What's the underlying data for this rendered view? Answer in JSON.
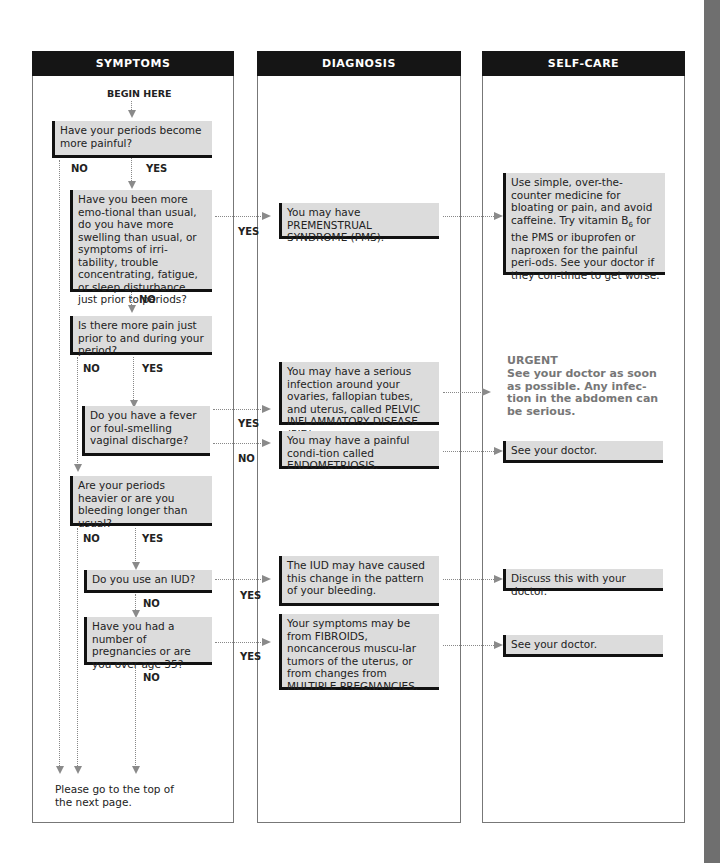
{
  "columns": {
    "symptoms": "SYMPTOMS",
    "diagnosis": "DIAGNOSIS",
    "selfcare": "SELF-CARE"
  },
  "begin_label": "BEGIN HERE",
  "questions": [
    {
      "id": "q1",
      "text": "Have your periods become more painful?"
    },
    {
      "id": "q2",
      "text": "Have you been more emo-tional than usual, do you have more swelling than usual, or symptoms of irri-tability, trouble concentrating, fatigue, or sleep disturbance just prior to periods?"
    },
    {
      "id": "q3",
      "text": "Is there more pain just prior to and during your period?"
    },
    {
      "id": "q4",
      "text": "Do you have a fever or foul-smelling vaginal discharge?"
    },
    {
      "id": "q5",
      "text": "Are your periods heavier or are you bleeding longer than usual?"
    },
    {
      "id": "q6",
      "text": "Do you use an IUD?"
    },
    {
      "id": "q7",
      "text": "Have you had a number of pregnancies or are you over age 35?"
    }
  ],
  "labels": {
    "yes": "YES",
    "no": "NO"
  },
  "diagnoses": [
    {
      "id": "pms",
      "text": "You may have PREMENSTRUAL SYNDROME (PMS)."
    },
    {
      "id": "pid",
      "text": "You may have a serious infection around your ovaries, fallopian tubes, and uterus, called PELVIC INFLAMMATORY DISEASE (PID)."
    },
    {
      "id": "endo",
      "text": "You may have a painful condi-tion called ENDOMETRIOSIS."
    },
    {
      "id": "iud",
      "text": "The IUD may have caused this change in the pattern of your bleeding."
    },
    {
      "id": "fibroids",
      "text": "Your symptoms may be from FIBROIDS, noncancerous muscu-lar tumors of the uterus, or from changes from MULTIPLE PREGNANCIES."
    }
  ],
  "selfcare": [
    {
      "id": "pms_care",
      "text_pre": "Use simple, over-the-counter medicine for bloating or pain, and avoid caffeine. Try vitamin B",
      "sub": "6",
      "text_post": " for the PMS or ibuprofen or naproxen for the painful peri-ods. See your doctor if they con-tinue to get worse."
    },
    {
      "id": "pid_care",
      "title": "URGENT",
      "text": "See your doctor as soon as possible. Any infec-tion in the abdomen can be serious."
    },
    {
      "id": "endo_care",
      "text": "See your doctor."
    },
    {
      "id": "iud_care",
      "text": "Discuss this with your doctor."
    },
    {
      "id": "fibroid_care",
      "text": "See your doctor."
    }
  ],
  "footer_note": "Please go to the top of the next page."
}
